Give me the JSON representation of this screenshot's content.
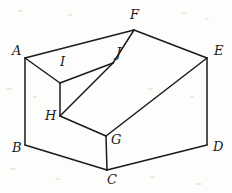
{
  "figure": {
    "kind": "geometric-line-drawing",
    "width": 232,
    "height": 193,
    "background_color": "#fdfdfc",
    "stroke_color": "#1a1a1a",
    "stroke_width": 1.5,
    "label_color": "#1a1a1a",
    "vertices": [
      {
        "id": "A",
        "label": "A",
        "x": 25,
        "y": 58,
        "label_x": 12,
        "label_y": 44
      },
      {
        "id": "B",
        "label": "B",
        "x": 25,
        "y": 145,
        "label_x": 12,
        "label_y": 141
      },
      {
        "id": "C",
        "label": "C",
        "x": 107,
        "y": 170,
        "label_x": 107,
        "label_y": 173
      },
      {
        "id": "D",
        "label": "D",
        "x": 207,
        "y": 145,
        "label_x": 213,
        "label_y": 140
      },
      {
        "id": "E",
        "label": "E",
        "x": 207,
        "y": 58,
        "label_x": 214,
        "label_y": 44
      },
      {
        "id": "F",
        "label": "F",
        "x": 134,
        "y": 30,
        "label_x": 130,
        "label_y": 8
      },
      {
        "id": "G",
        "label": "G",
        "x": 106,
        "y": 136,
        "label_x": 111,
        "label_y": 133
      },
      {
        "id": "H",
        "label": "H",
        "x": 60,
        "y": 116,
        "label_x": 45,
        "label_y": 109
      },
      {
        "id": "I",
        "label": "I",
        "x": 60,
        "y": 83,
        "label_x": 60,
        "label_y": 55
      },
      {
        "id": "J",
        "label": "J",
        "x": 113,
        "y": 63,
        "label_x": 116,
        "label_y": 46
      }
    ],
    "edges": [
      {
        "from": "A",
        "to": "F",
        "name": "edge-a-f"
      },
      {
        "from": "F",
        "to": "E",
        "name": "edge-f-e"
      },
      {
        "from": "A",
        "to": "B",
        "name": "edge-a-b"
      },
      {
        "from": "B",
        "to": "C",
        "name": "edge-b-c"
      },
      {
        "from": "C",
        "to": "D",
        "name": "edge-c-d"
      },
      {
        "from": "D",
        "to": "E",
        "name": "edge-d-e"
      },
      {
        "from": "A",
        "to": "I",
        "name": "edge-a-i"
      },
      {
        "from": "I",
        "to": "J",
        "name": "edge-i-j"
      },
      {
        "from": "J",
        "to": "F",
        "name": "edge-j-f"
      },
      {
        "from": "I",
        "to": "H",
        "name": "edge-i-h"
      },
      {
        "from": "H",
        "to": "J",
        "name": "edge-h-j"
      },
      {
        "from": "H",
        "to": "G",
        "name": "edge-h-g"
      },
      {
        "from": "G",
        "to": "E",
        "name": "edge-g-e"
      },
      {
        "from": "G",
        "to": "C",
        "name": "edge-g-c"
      }
    ],
    "specks": [
      {
        "x": 18,
        "y": 10,
        "w": 5,
        "h": 2
      },
      {
        "x": 68,
        "y": 14,
        "w": 4,
        "h": 2
      },
      {
        "x": 181,
        "y": 12,
        "w": 6,
        "h": 2
      },
      {
        "x": 205,
        "y": 18,
        "w": 4,
        "h": 2
      },
      {
        "x": 6,
        "y": 88,
        "w": 6,
        "h": 2
      },
      {
        "x": 33,
        "y": 96,
        "w": 4,
        "h": 2
      },
      {
        "x": 148,
        "y": 88,
        "w": 5,
        "h": 2
      },
      {
        "x": 190,
        "y": 96,
        "w": 4,
        "h": 2
      },
      {
        "x": 10,
        "y": 168,
        "w": 6,
        "h": 2
      },
      {
        "x": 55,
        "y": 178,
        "w": 5,
        "h": 2
      },
      {
        "x": 150,
        "y": 176,
        "w": 5,
        "h": 2
      },
      {
        "x": 196,
        "y": 183,
        "w": 6,
        "h": 2
      }
    ]
  }
}
